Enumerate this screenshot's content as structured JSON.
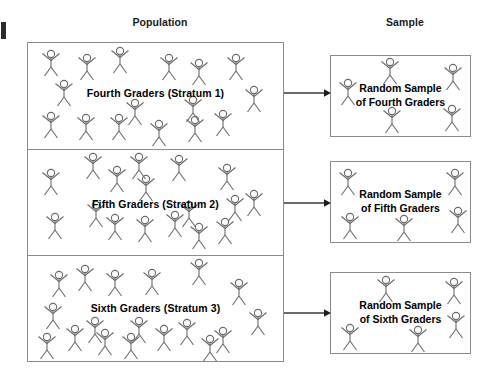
{
  "diagram": {
    "headers": {
      "population": "Population",
      "sample": "Sample"
    },
    "colors": {
      "box_border": "#8b8b8b",
      "figure_stroke": "#6b6b6b",
      "text": "#000000",
      "arrow": "#3a3a3a",
      "background": "#ffffff"
    },
    "population": {
      "strata": [
        {
          "id": "stratum-1",
          "label": "Fourth Graders (Stratum 1)",
          "figure_count": 16,
          "figures": [
            {
              "x": 12,
              "y": 6
            },
            {
              "x": 48,
              "y": 10
            },
            {
              "x": 81,
              "y": 3
            },
            {
              "x": 130,
              "y": 10
            },
            {
              "x": 160,
              "y": 15
            },
            {
              "x": 197,
              "y": 10
            },
            {
              "x": 25,
              "y": 36
            },
            {
              "x": 215,
              "y": 42
            },
            {
              "x": 96,
              "y": 55
            },
            {
              "x": 154,
              "y": 52
            },
            {
              "x": 12,
              "y": 68
            },
            {
              "x": 47,
              "y": 70
            },
            {
              "x": 80,
              "y": 70
            },
            {
              "x": 120,
              "y": 76
            },
            {
              "x": 156,
              "y": 72
            },
            {
              "x": 184,
              "y": 66
            }
          ]
        },
        {
          "id": "stratum-2",
          "label": "Fifth Graders (Stratum 2)",
          "figure_count": 17,
          "figures": [
            {
              "x": 54,
              "y": 2
            },
            {
              "x": 100,
              "y": 2
            },
            {
              "x": 140,
              "y": 4
            },
            {
              "x": 12,
              "y": 18
            },
            {
              "x": 78,
              "y": 15
            },
            {
              "x": 188,
              "y": 13
            },
            {
              "x": 107,
              "y": 24
            },
            {
              "x": 215,
              "y": 39
            },
            {
              "x": 57,
              "y": 50
            },
            {
              "x": 150,
              "y": 50
            },
            {
              "x": 196,
              "y": 44
            },
            {
              "x": 16,
              "y": 62
            },
            {
              "x": 76,
              "y": 63
            },
            {
              "x": 106,
              "y": 65
            },
            {
              "x": 136,
              "y": 60
            },
            {
              "x": 160,
              "y": 72
            },
            {
              "x": 186,
              "y": 67
            }
          ]
        },
        {
          "id": "stratum-3",
          "label": "Sixth Graders (Stratum 3)",
          "figure_count": 18,
          "figures": [
            {
              "x": 160,
              "y": 2
            },
            {
              "x": 20,
              "y": 14
            },
            {
              "x": 46,
              "y": 8
            },
            {
              "x": 76,
              "y": 13
            },
            {
              "x": 113,
              "y": 12
            },
            {
              "x": 200,
              "y": 22
            },
            {
              "x": 14,
              "y": 46
            },
            {
              "x": 219,
              "y": 52
            },
            {
              "x": 100,
              "y": 60
            },
            {
              "x": 36,
              "y": 68
            },
            {
              "x": 66,
              "y": 72
            },
            {
              "x": 125,
              "y": 68
            },
            {
              "x": 148,
              "y": 62
            },
            {
              "x": 184,
              "y": 70
            },
            {
              "x": 92,
              "y": 76
            },
            {
              "x": 56,
              "y": 60
            },
            {
              "x": 171,
              "y": 78
            },
            {
              "x": 8,
              "y": 76
            }
          ]
        }
      ]
    },
    "samples": [
      {
        "id": "sample-box-1",
        "label_line1": "Random Sample",
        "label_line2": "of Fourth Graders",
        "figure_count": 5,
        "figures": [
          {
            "x": 48,
            "y": 1
          },
          {
            "x": 111,
            "y": 7
          },
          {
            "x": 6,
            "y": 22
          },
          {
            "x": 50,
            "y": 50
          },
          {
            "x": 110,
            "y": 48
          }
        ]
      },
      {
        "id": "sample-box-2",
        "label_line1": "Random Sample",
        "label_line2": "of Fifth Graders",
        "figure_count": 5,
        "figures": [
          {
            "x": 6,
            "y": 6
          },
          {
            "x": 113,
            "y": 6
          },
          {
            "x": 8,
            "y": 50
          },
          {
            "x": 62,
            "y": 52
          },
          {
            "x": 116,
            "y": 44
          }
        ]
      },
      {
        "id": "sample-box-3",
        "label_line1": "Random Sample",
        "label_line2": "of Sixth Graders",
        "figure_count": 5,
        "figures": [
          {
            "x": 44,
            "y": 2
          },
          {
            "x": 112,
            "y": 4
          },
          {
            "x": 114,
            "y": 38
          },
          {
            "x": 8,
            "y": 50
          },
          {
            "x": 76,
            "y": 52
          }
        ]
      }
    ],
    "arrows": [
      {
        "id": "arrow-1",
        "from": "stratum-1",
        "to": "sample-box-1"
      },
      {
        "id": "arrow-2",
        "from": "stratum-2",
        "to": "sample-box-2"
      },
      {
        "id": "arrow-3",
        "from": "stratum-3",
        "to": "sample-box-3"
      }
    ]
  }
}
